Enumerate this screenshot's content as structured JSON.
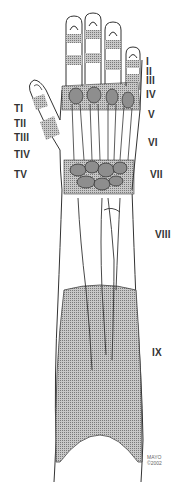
{
  "figure": {
    "colors": {
      "line": "#333333",
      "shade": "#9a9a9a",
      "background": "#ffffff"
    }
  },
  "labels": {
    "right": [
      {
        "text": "I",
        "x": 146,
        "y": 57
      },
      {
        "text": "II",
        "x": 146,
        "y": 67
      },
      {
        "text": "III",
        "x": 146,
        "y": 75
      },
      {
        "text": "IV",
        "x": 146,
        "y": 90
      },
      {
        "text": "V",
        "x": 148,
        "y": 110
      },
      {
        "text": "VI",
        "x": 148,
        "y": 138
      },
      {
        "text": "VII",
        "x": 150,
        "y": 170
      },
      {
        "text": "VIII",
        "x": 155,
        "y": 230
      },
      {
        "text": "IX",
        "x": 152,
        "y": 348
      }
    ],
    "left": [
      {
        "text": "TI",
        "x": 14,
        "y": 104
      },
      {
        "text": "TII",
        "x": 14,
        "y": 119
      },
      {
        "text": "TIII",
        "x": 14,
        "y": 133
      },
      {
        "text": "TIV",
        "x": 14,
        "y": 150
      },
      {
        "text": "TV",
        "x": 14,
        "y": 170
      }
    ]
  },
  "credit": {
    "line1": "MAYO",
    "line2": "©2002"
  }
}
